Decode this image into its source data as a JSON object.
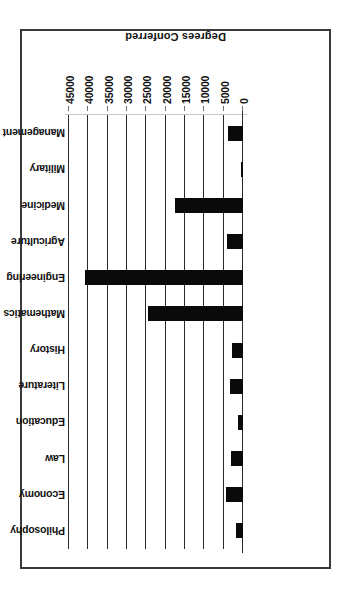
{
  "figure": {
    "orientation": "rotated-180",
    "border_color": "#3a3a3a",
    "bar_color": "#0a0a0a",
    "gridline_color": "#2b2b2b",
    "background": "#ffffff"
  },
  "chart_data": {
    "type": "bar",
    "orientation": "horizontal",
    "title": "",
    "subtitle": "",
    "xlabel": "Degrees Conferred",
    "ylabel": "",
    "categories": [
      "Philosophy",
      "Economy",
      "Law",
      "Education",
      "Literature",
      "History",
      "Mathematics",
      "Engineering",
      "Agriculture",
      "Medicine",
      "Military",
      "Management"
    ],
    "values": [
      1800,
      4300,
      3000,
      1200,
      3300,
      2800,
      24500,
      40800,
      4200,
      17500,
      600,
      3800
    ],
    "xlim": [
      0,
      45000
    ],
    "tick_labels": [
      "0",
      "5000",
      "10000",
      "15000",
      "20000",
      "25000",
      "30000",
      "35000",
      "40000",
      "45000"
    ],
    "tick_values": [
      0,
      5000,
      10000,
      15000,
      20000,
      25000,
      30000,
      35000,
      40000,
      45000
    ],
    "grid": true,
    "grid_axis": "value",
    "legend": null,
    "legend_position": "none",
    "annotations": []
  }
}
